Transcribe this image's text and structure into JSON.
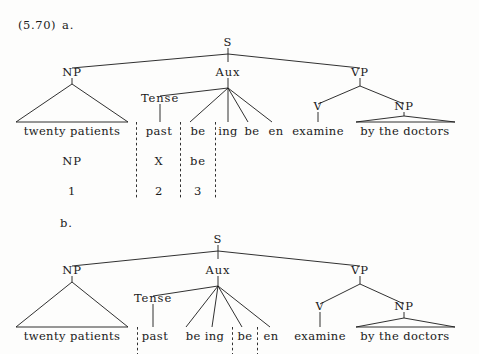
{
  "figure": {
    "example_number": "(5.70)",
    "subfigure_a_label": "a.",
    "subfigure_b_label": "b."
  },
  "ink_color": "#1a1a1a",
  "background_color": "#fdfdfc",
  "tree_a": {
    "nodes": {
      "s": "S",
      "np": "NP",
      "aux": "Aux",
      "vp": "VP",
      "tense": "Tense",
      "v": "V",
      "np2": "NP"
    },
    "terminals": {
      "subject": "twenty patients",
      "past": "past",
      "be1": "be",
      "ing": "ing",
      "be2": "be",
      "en": "en",
      "verb": "examine",
      "agent": "by the doctors"
    },
    "analysis_row": {
      "col1": "NP",
      "col2": "X",
      "col3": "be"
    },
    "index_row": {
      "col1": "1",
      "col2": "2",
      "col3": "3"
    }
  },
  "tree_b": {
    "nodes": {
      "s": "S",
      "np": "NP",
      "aux": "Aux",
      "vp": "VP",
      "tense": "Tense",
      "v": "V",
      "np2": "NP"
    },
    "terminals": {
      "subject": "twenty patients",
      "past": "past",
      "being": "be ing",
      "be2": "be",
      "en": "en",
      "verb": "examine",
      "agent": "by the doctors"
    }
  }
}
